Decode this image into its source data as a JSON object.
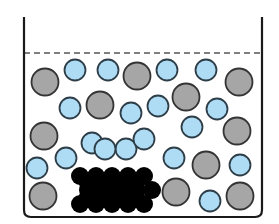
{
  "diagram": {
    "colors": {
      "container_stroke": "#1a1a1a",
      "liquid_level_stroke": "#555555",
      "solute_particle_fill": "#aedcf5",
      "solute_particle_stroke": "#2e3e48",
      "other_particle_fill": "#a6a6a6",
      "other_particle_stroke": "#333333",
      "solid_fill": "#000000"
    },
    "particle_counts": {
      "light_blue": 20,
      "gray": 13,
      "black_solid": 24
    },
    "elements": {
      "container": "beaker",
      "liquid_level": "dashed-line",
      "solid": "crystal-lattice"
    }
  }
}
